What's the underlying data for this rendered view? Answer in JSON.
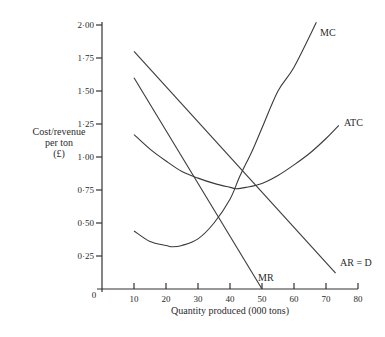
{
  "chart_data": {
    "type": "line",
    "title": "",
    "xlabel": "Quantity produced (000 tons)",
    "ylabel": "Cost/revenue per ton (£)",
    "ylabel_lines": [
      "Cost/revenue",
      "per ton",
      "(£)"
    ],
    "xlim": [
      0,
      80
    ],
    "ylim": [
      0,
      2.0
    ],
    "grid": false,
    "legend": "none (curves labelled directly at line ends)",
    "x_ticks": [
      0,
      10,
      20,
      30,
      40,
      50,
      60,
      70,
      80
    ],
    "x_tick_labels": [
      "0",
      "10",
      "20",
      "30",
      "40",
      "50",
      "60",
      "70",
      "80"
    ],
    "y_ticks": [
      0.25,
      0.5,
      0.75,
      1.0,
      1.25,
      1.5,
      1.75,
      2.0
    ],
    "y_tick_labels": [
      "0·25",
      "0·50",
      "0·75",
      "1·00",
      "1·25",
      "1·50",
      "1·75",
      "2·00"
    ],
    "series": [
      {
        "name": "MC",
        "label": "MC",
        "x": [
          10,
          15,
          20,
          22,
          25,
          30,
          35,
          40,
          43,
          47,
          50,
          55,
          60,
          67
        ],
        "y": [
          0.44,
          0.36,
          0.33,
          0.32,
          0.33,
          0.38,
          0.5,
          0.68,
          0.85,
          1.05,
          1.22,
          1.5,
          1.68,
          2.02
        ]
      },
      {
        "name": "ATC",
        "label": "ATC",
        "x": [
          10,
          15,
          20,
          25,
          30,
          35,
          40,
          42,
          45,
          50,
          55,
          60,
          65,
          70,
          74
        ],
        "y": [
          1.17,
          1.06,
          0.97,
          0.89,
          0.84,
          0.8,
          0.77,
          0.76,
          0.77,
          0.8,
          0.86,
          0.94,
          1.03,
          1.14,
          1.24
        ]
      },
      {
        "name": "AR = D",
        "label": "AR = D",
        "x": [
          10,
          73
        ],
        "y": [
          1.8,
          0.12
        ]
      },
      {
        "name": "MR",
        "label": "MR",
        "x": [
          10,
          50
        ],
        "y": [
          1.6,
          0.0
        ]
      }
    ],
    "annotations": [
      "MC",
      "ATC",
      "AR = D",
      "MR"
    ]
  }
}
